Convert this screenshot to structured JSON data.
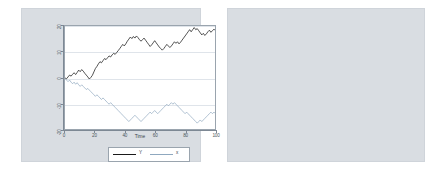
{
  "figure": {
    "panels": 2,
    "background_color": "#ffffff",
    "panel_background": "#d9dde2",
    "plot_background": "#ffffff",
    "line_color_y": "#1a1a1a",
    "line_color_x": "#8fa8bf",
    "marker_color": "#2e6da4",
    "grid_color": "#dfe4ea"
  },
  "chart_data": [
    {
      "type": "line",
      "title": "",
      "xlabel": "Time",
      "ylabel": "",
      "xlim": [
        0,
        100
      ],
      "ylim": [
        -20,
        20
      ],
      "xticks": [
        0,
        20,
        40,
        60,
        80,
        100
      ],
      "yticks": [
        -20,
        -10,
        0,
        10,
        20
      ],
      "xtick_labels": [
        "0",
        "20",
        "40",
        "60",
        "80",
        "100"
      ],
      "ytick_labels": [
        "-20",
        "-10",
        "0",
        "10",
        "20"
      ],
      "grid": "horizontal",
      "legend_position": "below",
      "legend": [
        "Y",
        "x"
      ],
      "x": [
        0,
        1,
        2,
        3,
        4,
        5,
        6,
        7,
        8,
        9,
        10,
        11,
        12,
        13,
        14,
        15,
        16,
        17,
        18,
        19,
        20,
        21,
        22,
        23,
        24,
        25,
        26,
        27,
        28,
        29,
        30,
        31,
        32,
        33,
        34,
        35,
        36,
        37,
        38,
        39,
        40,
        41,
        42,
        43,
        44,
        45,
        46,
        47,
        48,
        49,
        50,
        51,
        52,
        53,
        54,
        55,
        56,
        57,
        58,
        59,
        60,
        61,
        62,
        63,
        64,
        65,
        66,
        67,
        68,
        69,
        70,
        71,
        72,
        73,
        74,
        75,
        76,
        77,
        78,
        79,
        80,
        81,
        82,
        83,
        84,
        85,
        86,
        87,
        88,
        89,
        90,
        91,
        92,
        93,
        94,
        95,
        96,
        97,
        98,
        99,
        100
      ],
      "series": [
        {
          "name": "Y",
          "values": [
            0.2,
            -0.1,
            0.6,
            1.3,
            0.9,
            1.6,
            2.2,
            1.5,
            2.3,
            3.2,
            2.6,
            3.4,
            2.8,
            2.0,
            1.3,
            0.6,
            -0.2,
            0.4,
            1.2,
            2.5,
            3.8,
            4.6,
            5.6,
            6.4,
            6.0,
            6.8,
            7.6,
            7.2,
            7.9,
            8.6,
            8.2,
            9.0,
            9.6,
            9.2,
            9.9,
            10.6,
            11.4,
            12.2,
            13.0,
            12.4,
            13.2,
            14.2,
            15.0,
            15.8,
            15.2,
            16.0,
            15.4,
            16.2,
            15.6,
            14.8,
            14.2,
            14.8,
            15.4,
            14.6,
            13.8,
            13.0,
            12.2,
            12.8,
            13.6,
            14.4,
            13.6,
            12.8,
            12.0,
            11.4,
            10.8,
            11.4,
            12.2,
            13.0,
            12.4,
            11.8,
            12.4,
            13.2,
            14.0,
            13.4,
            14.0,
            13.2,
            13.8,
            14.6,
            15.4,
            16.2,
            17.0,
            17.8,
            18.6,
            17.8,
            18.6,
            19.4,
            18.6,
            19.0,
            18.2,
            17.4,
            16.6,
            17.2,
            16.4,
            17.0,
            17.8,
            18.4,
            17.6,
            18.2,
            18.8,
            18.2,
            18.8
          ]
        },
        {
          "name": "x",
          "values": [
            0.0,
            -0.6,
            -1.2,
            -0.6,
            -1.4,
            -2.0,
            -1.4,
            -2.2,
            -1.6,
            -2.4,
            -3.0,
            -2.4,
            -3.0,
            -3.6,
            -4.2,
            -3.8,
            -4.4,
            -5.0,
            -5.6,
            -6.2,
            -6.8,
            -6.2,
            -6.8,
            -7.4,
            -8.0,
            -7.4,
            -8.0,
            -8.6,
            -9.2,
            -9.8,
            -9.2,
            -9.8,
            -10.4,
            -11.0,
            -11.6,
            -12.2,
            -12.8,
            -13.4,
            -14.0,
            -14.6,
            -15.2,
            -15.8,
            -16.4,
            -15.8,
            -15.2,
            -14.6,
            -14.0,
            -14.6,
            -15.2,
            -15.8,
            -16.4,
            -15.8,
            -15.2,
            -14.6,
            -14.0,
            -13.4,
            -12.8,
            -13.4,
            -12.8,
            -12.2,
            -12.8,
            -13.4,
            -12.8,
            -12.2,
            -11.6,
            -11.0,
            -10.4,
            -9.8,
            -10.4,
            -9.8,
            -9.2,
            -9.8,
            -9.2,
            -9.8,
            -10.4,
            -11.0,
            -11.6,
            -12.2,
            -12.8,
            -13.4,
            -12.8,
            -13.4,
            -14.0,
            -14.6,
            -15.2,
            -15.8,
            -16.4,
            -17.0,
            -16.4,
            -15.8,
            -16.4,
            -15.8,
            -15.2,
            -14.6,
            -14.0,
            -13.4,
            -12.8,
            -13.4,
            -12.8,
            -13.4,
            -12.8
          ]
        }
      ]
    },
    {
      "type": "scatter",
      "title": "",
      "xlabel": "x",
      "ylabel": "Y",
      "xlim": [
        -2,
        21.5
      ],
      "ylim": [
        -20,
        1
      ],
      "xticks": [
        0,
        5,
        10,
        15,
        20
      ],
      "yticks": [
        -20,
        -15,
        -10,
        -5,
        0
      ],
      "xtick_labels": [
        "0",
        "5",
        "10",
        "15",
        "20"
      ],
      "ytick_labels": [
        "-20",
        "-15",
        "-10",
        "-5",
        "0"
      ],
      "grid": "horizontal",
      "legend_position": "none",
      "marker": "circle",
      "points": [
        [
          -1.3,
          -3.4
        ],
        [
          -1.1,
          -4.2
        ],
        [
          -1.0,
          -3.0
        ],
        [
          -0.9,
          -4.9
        ],
        [
          -0.8,
          -3.6
        ],
        [
          -0.7,
          -2.9
        ],
        [
          -0.6,
          -4.4
        ],
        [
          -0.5,
          -3.2
        ],
        [
          -0.4,
          -5.1
        ],
        [
          -0.3,
          -2.4
        ],
        [
          -0.2,
          -4.0
        ],
        [
          -0.1,
          -3.3
        ],
        [
          0.0,
          -0.7
        ],
        [
          0.1,
          -2.1
        ],
        [
          0.2,
          -4.6
        ],
        [
          0.3,
          -3.8
        ],
        [
          0.4,
          -5.4
        ],
        [
          0.6,
          -2.6
        ],
        [
          0.8,
          -4.1
        ],
        [
          1.0,
          -3.5
        ],
        [
          1.1,
          -7.0
        ],
        [
          1.2,
          -5.6
        ],
        [
          1.4,
          -2.2
        ],
        [
          1.6,
          -3.9
        ],
        [
          1.8,
          -3.1
        ],
        [
          1.9,
          -3.4
        ],
        [
          2.0,
          -4.8
        ],
        [
          2.2,
          -3.3
        ],
        [
          2.4,
          -5.9
        ],
        [
          2.6,
          -8.2
        ],
        [
          2.8,
          -4.6
        ],
        [
          3.0,
          -9.1
        ],
        [
          3.2,
          -8.6
        ],
        [
          3.4,
          -9.4
        ],
        [
          3.5,
          -8.0
        ],
        [
          3.6,
          -9.8
        ],
        [
          3.8,
          -5.0
        ],
        [
          4.0,
          -4.4
        ],
        [
          4.2,
          -10.2
        ],
        [
          4.5,
          -9.6
        ],
        [
          4.8,
          -8.9
        ],
        [
          5.0,
          -12.1
        ],
        [
          5.4,
          -11.0
        ],
        [
          5.8,
          -10.6
        ],
        [
          6.0,
          -8.4
        ],
        [
          6.3,
          -12.4
        ],
        [
          6.6,
          -11.6
        ],
        [
          6.9,
          -12.2
        ],
        [
          7.2,
          -10.8
        ],
        [
          7.5,
          -11.9
        ],
        [
          7.8,
          -12.6
        ],
        [
          8.2,
          -13.8
        ],
        [
          8.5,
          -14.0
        ],
        [
          8.8,
          -15.0
        ],
        [
          9.0,
          -13.4
        ],
        [
          9.3,
          -15.4
        ],
        [
          9.6,
          -16.2
        ],
        [
          10.0,
          -11.4
        ],
        [
          10.2,
          -14.2
        ],
        [
          10.4,
          -14.6
        ],
        [
          10.6,
          -10.6
        ],
        [
          10.8,
          -14.4
        ],
        [
          11.0,
          -14.0
        ],
        [
          11.1,
          -14.3
        ],
        [
          11.2,
          -14.8
        ],
        [
          11.3,
          -14.1
        ],
        [
          11.4,
          -11.2
        ],
        [
          11.5,
          -14.5
        ],
        [
          11.6,
          -13.6
        ],
        [
          11.8,
          -17.0
        ],
        [
          12.0,
          -12.6
        ],
        [
          12.2,
          -14.2
        ],
        [
          12.4,
          -16.8
        ],
        [
          12.6,
          -11.0
        ],
        [
          12.8,
          -14.0
        ],
        [
          13.0,
          -17.2
        ],
        [
          13.2,
          -13.2
        ],
        [
          13.4,
          -14.6
        ],
        [
          13.6,
          -13.8
        ],
        [
          13.8,
          -10.4
        ],
        [
          13.9,
          -10.2
        ],
        [
          14.0,
          -10.3
        ],
        [
          14.2,
          -12.4
        ],
        [
          14.4,
          -16.8
        ],
        [
          14.6,
          -14.8
        ],
        [
          14.8,
          -11.6
        ],
        [
          15.0,
          -15.2
        ],
        [
          15.2,
          -17.0
        ],
        [
          15.4,
          -14.4
        ],
        [
          15.6,
          -14.8
        ],
        [
          15.8,
          -15.0
        ],
        [
          16.0,
          -12.8
        ],
        [
          16.2,
          -16.6
        ],
        [
          16.4,
          -14.2
        ],
        [
          16.6,
          -17.4
        ],
        [
          16.8,
          -18.4
        ],
        [
          17.0,
          -13.0
        ],
        [
          17.4,
          -16.8
        ],
        [
          17.6,
          -12.2
        ],
        [
          18.0,
          -13.6
        ],
        [
          18.2,
          -17.2
        ],
        [
          18.4,
          -14.8
        ],
        [
          18.6,
          -17.0
        ],
        [
          18.8,
          -12.4
        ],
        [
          19.0,
          -13.8
        ],
        [
          19.2,
          -14.2
        ],
        [
          19.4,
          -16.4
        ],
        [
          19.6,
          -13.2
        ],
        [
          20.0,
          -14.0
        ],
        [
          20.6,
          -15.2
        ],
        [
          21.0,
          -15.1
        ]
      ]
    }
  ]
}
